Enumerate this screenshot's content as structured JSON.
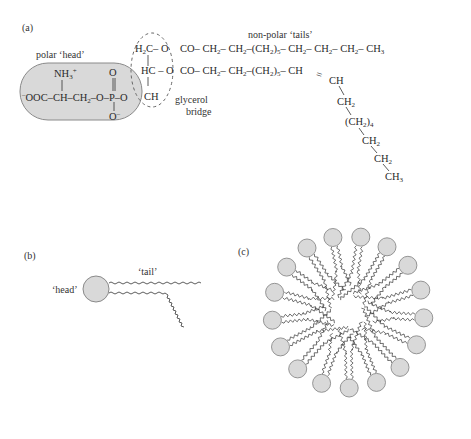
{
  "panels": {
    "a": {
      "label": "(a)",
      "head_label": "polar ‘head’",
      "tails_label": "non-polar ‘tails’",
      "glycerol_label_1": "glycerol",
      "glycerol_label_2": "bridge",
      "head_group": {
        "nh3": "NH",
        "nh3_sub": "3",
        "nh3_sup": "+",
        "main_chain": "OOC–CH–CH",
        "main_chain_minus": "–",
        "ch2_sub": "2",
        "phosphate_chain": "–O–P–O",
        "top_o": "O",
        "bottom_o": "O",
        "bottom_o_sup": "–"
      },
      "glycerol": {
        "row1": "H",
        "row1_sub": "2",
        "row1_rest": "C– O",
        "row2": "HC – O",
        "row3": "CH"
      },
      "tail1": [
        "CO– CH",
        "2",
        "– CH",
        "2",
        "–(CH",
        "2",
        ")",
        "5",
        "– CH",
        "2",
        "– CH",
        "2",
        "– CH",
        "2",
        "– CH",
        "3"
      ],
      "tail2": [
        "CO– CH",
        "2",
        "– CH",
        "2",
        "–(CH",
        "2",
        ")",
        "5",
        "– CH"
      ],
      "double_bond": "=",
      "branch": [
        {
          "text": "CH",
          "sub": ""
        },
        {
          "text": "CH",
          "sub": "2"
        },
        {
          "text": "(CH",
          "sub": "2",
          "after": ")",
          "after_sub": "4"
        },
        {
          "text": "CH",
          "sub": "2"
        },
        {
          "text": "CH",
          "sub": "2"
        },
        {
          "text": "CH",
          "sub": "3"
        }
      ]
    },
    "b": {
      "label": "(b)",
      "head_label": "‘head’",
      "tail_label": "‘tail’"
    },
    "c": {
      "label": "(c)",
      "head_count": 17
    }
  },
  "colors": {
    "head_fill": "#d9d9d9",
    "head_stroke": "#8a8a8a",
    "line": "#333333",
    "halo": "#f1f1f1"
  }
}
